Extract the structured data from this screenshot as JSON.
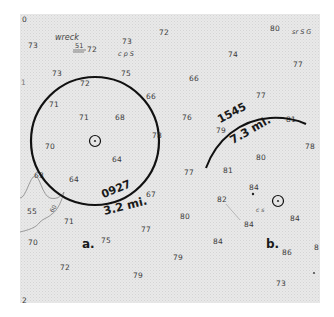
{
  "chart": {
    "background": "#e9e9e9",
    "line_color": "#1a1a1a",
    "edge_soundings": {
      "top_left": "0",
      "left_1": "1",
      "bottom_left": "2",
      "right_edge": "8"
    },
    "wreck": {
      "label": "wreck",
      "depth": "51",
      "sounding": "72"
    },
    "bottom_notes": {
      "cps": "c p S",
      "srsg": "sr S G",
      "cs": "c s"
    },
    "panels": {
      "a": {
        "label": "a.",
        "time": "0927",
        "distance": "3.2 mi."
      },
      "b": {
        "label": "b.",
        "time": "1545",
        "distance": "7.3 mi."
      }
    },
    "contour_label": "60",
    "soundings": [
      {
        "value": "73",
        "x": 28,
        "y": 46
      },
      {
        "value": "73",
        "x": 122,
        "y": 42
      },
      {
        "value": "72",
        "x": 159,
        "y": 33
      },
      {
        "value": "80",
        "x": 270,
        "y": 29
      },
      {
        "value": "74",
        "x": 228,
        "y": 55
      },
      {
        "value": "77",
        "x": 293,
        "y": 65
      },
      {
        "value": "73",
        "x": 52,
        "y": 74
      },
      {
        "value": "75",
        "x": 121,
        "y": 74
      },
      {
        "value": "72",
        "x": 80,
        "y": 84
      },
      {
        "value": "66",
        "x": 189,
        "y": 79
      },
      {
        "value": "66",
        "x": 146,
        "y": 97
      },
      {
        "value": "77",
        "x": 256,
        "y": 96
      },
      {
        "value": "71",
        "x": 49,
        "y": 105
      },
      {
        "value": "71",
        "x": 79,
        "y": 118
      },
      {
        "value": "68",
        "x": 115,
        "y": 118
      },
      {
        "value": "76",
        "x": 182,
        "y": 118
      },
      {
        "value": "79",
        "x": 216,
        "y": 131
      },
      {
        "value": "81",
        "x": 286,
        "y": 120
      },
      {
        "value": "78",
        "x": 152,
        "y": 136
      },
      {
        "value": "78",
        "x": 305,
        "y": 147
      },
      {
        "value": "70",
        "x": 45,
        "y": 147
      },
      {
        "value": "64",
        "x": 112,
        "y": 160
      },
      {
        "value": "77",
        "x": 184,
        "y": 173
      },
      {
        "value": "80",
        "x": 256,
        "y": 158
      },
      {
        "value": "81",
        "x": 223,
        "y": 171
      },
      {
        "value": "63",
        "x": 34,
        "y": 176
      },
      {
        "value": "64",
        "x": 69,
        "y": 180
      },
      {
        "value": "67",
        "x": 146,
        "y": 195
      },
      {
        "value": "84",
        "x": 249,
        "y": 188
      },
      {
        "value": "82",
        "x": 217,
        "y": 200
      },
      {
        "value": "55",
        "x": 27,
        "y": 212
      },
      {
        "value": "71",
        "x": 64,
        "y": 222
      },
      {
        "value": "80",
        "x": 180,
        "y": 217
      },
      {
        "value": "84",
        "x": 244,
        "y": 225
      },
      {
        "value": "84",
        "x": 290,
        "y": 219
      },
      {
        "value": "77",
        "x": 141,
        "y": 230
      },
      {
        "value": "70",
        "x": 28,
        "y": 243
      },
      {
        "value": "75",
        "x": 101,
        "y": 241
      },
      {
        "value": "84",
        "x": 213,
        "y": 242
      },
      {
        "value": "86",
        "x": 282,
        "y": 253
      },
      {
        "value": "79",
        "x": 173,
        "y": 258
      },
      {
        "value": "72",
        "x": 60,
        "y": 268
      },
      {
        "value": "79",
        "x": 133,
        "y": 276
      },
      {
        "value": "73",
        "x": 276,
        "y": 284
      }
    ]
  }
}
